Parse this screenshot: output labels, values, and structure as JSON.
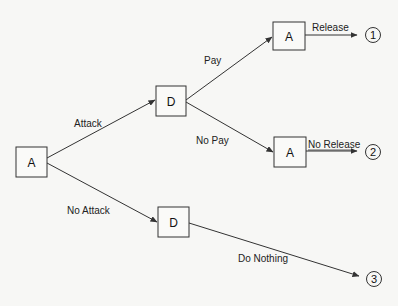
{
  "diagram": {
    "type": "game-tree",
    "colors": {
      "background": "#f7f7f5",
      "stroke": "#333333",
      "text": "#111111"
    },
    "nodes": [
      {
        "id": "root",
        "label": "A",
        "x": 16,
        "y": 147,
        "w": 31,
        "h": 30
      },
      {
        "id": "d_attack",
        "label": "D",
        "x": 156,
        "y": 86,
        "w": 30,
        "h": 30
      },
      {
        "id": "d_noattack",
        "label": "D",
        "x": 158,
        "y": 207,
        "w": 31,
        "h": 30
      },
      {
        "id": "a_pay",
        "label": "A",
        "x": 273,
        "y": 22,
        "w": 32,
        "h": 28
      },
      {
        "id": "a_nopay",
        "label": "A",
        "x": 274,
        "y": 137,
        "w": 32,
        "h": 30
      }
    ],
    "terminals": [
      {
        "id": "t1",
        "label": "1",
        "cx": 373,
        "cy": 35
      },
      {
        "id": "t2",
        "label": "2",
        "cx": 373,
        "cy": 152
      },
      {
        "id": "t3",
        "label": "3",
        "cx": 374,
        "cy": 279
      }
    ],
    "edges": [
      {
        "from": "root",
        "to": "d_attack",
        "label": "Attack"
      },
      {
        "from": "root",
        "to": "d_noattack",
        "label": "No Attack"
      },
      {
        "from": "d_attack",
        "to": "a_pay",
        "label": "Pay"
      },
      {
        "from": "d_attack",
        "to": "a_nopay",
        "label": "No Pay"
      },
      {
        "from": "a_pay",
        "to": "t1",
        "label": "Release"
      },
      {
        "from": "a_nopay",
        "to": "t2",
        "label": "No Release"
      },
      {
        "from": "d_noattack",
        "to": "t3",
        "label": "Do Nothing"
      }
    ]
  }
}
